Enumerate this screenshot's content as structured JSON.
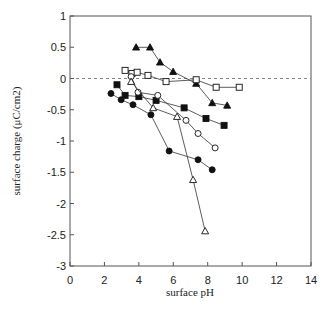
{
  "chart_data": {
    "type": "scatter",
    "title": "",
    "xlabel": "surface pH",
    "ylabel": "surface charge (μC/cm2)",
    "xlim": [
      0,
      14
    ],
    "ylim": [
      -3,
      1
    ],
    "x_ticks": [
      0,
      2,
      4,
      6,
      8,
      10,
      12,
      14
    ],
    "y_ticks": [
      1,
      0.5,
      0,
      -0.5,
      -1,
      -1.5,
      -2,
      -2.5,
      -3
    ],
    "y_tick_labels": [
      "1",
      "0.5",
      "0",
      "-0.5",
      "-1",
      "-1.5",
      "-2",
      "-2.5",
      "-3"
    ],
    "grid": false,
    "reference_line": {
      "y": 0,
      "style": "dashed"
    },
    "legend": null,
    "series": [
      {
        "name": "filled-triangle",
        "marker": "triangle",
        "filled": true,
        "x": [
          3.84,
          4.65,
          5.23,
          5.99,
          7.33,
          8.26,
          9.13
        ],
        "y": [
          0.5,
          0.5,
          0.26,
          0.11,
          -0.08,
          -0.39,
          -0.43
        ]
      },
      {
        "name": "open-square",
        "marker": "square",
        "filled": false,
        "x": [
          3.2,
          3.6,
          3.9,
          4.53,
          5.58,
          7.33,
          8.49,
          9.83
        ],
        "y": [
          0.13,
          0.08,
          0.1,
          0.05,
          -0.05,
          -0.02,
          -0.14,
          -0.14
        ]
      },
      {
        "name": "filled-square",
        "marker": "square",
        "filled": true,
        "x": [
          2.73,
          3.2,
          4.0,
          5.0,
          6.63,
          7.9,
          8.95
        ],
        "y": [
          -0.1,
          -0.27,
          -0.29,
          -0.35,
          -0.47,
          -0.64,
          -0.75
        ]
      },
      {
        "name": "open-circle",
        "marker": "circle",
        "filled": false,
        "x": [
          3.55,
          3.95,
          5.1,
          6.74,
          7.44,
          8.43
        ],
        "y": [
          0.03,
          -0.22,
          -0.27,
          -0.67,
          -0.88,
          -1.11
        ]
      },
      {
        "name": "open-triangle",
        "marker": "triangle",
        "filled": false,
        "x": [
          3.55,
          4.83,
          6.22,
          7.15,
          7.85
        ],
        "y": [
          -0.05,
          -0.47,
          -0.61,
          -1.62,
          -2.44
        ]
      },
      {
        "name": "filled-circle",
        "marker": "circle",
        "filled": true,
        "x": [
          2.38,
          2.97,
          3.66,
          4.7,
          5.76,
          7.44,
          8.26
        ],
        "y": [
          -0.24,
          -0.34,
          -0.42,
          -0.58,
          -1.16,
          -1.3,
          -1.46
        ]
      }
    ]
  },
  "axes": {
    "x_title": "surface pH",
    "y_title": "surface charge (μC/cm2)"
  }
}
